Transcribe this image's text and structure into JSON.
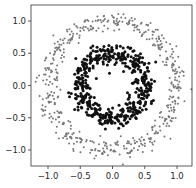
{
  "chart_data": {
    "type": "scatter",
    "title": "",
    "xlabel": "",
    "ylabel": "",
    "xlim": [
      -1.25,
      1.25
    ],
    "ylim": [
      -1.2,
      1.3
    ],
    "xticks": [
      -1.0,
      -0.5,
      0.0,
      0.5,
      1.0
    ],
    "xtick_labels": [
      "−1.0",
      "−0.5",
      "0.0",
      "0.5",
      "1.0"
    ],
    "yticks": [
      1.0,
      0.5,
      0.0,
      -0.5,
      -1.0
    ],
    "ytick_labels": [
      "1.0",
      "0.5",
      "0.0",
      "−0.5",
      "−1.0"
    ],
    "grid": false,
    "legend": null,
    "series": [
      {
        "name": "outer circle",
        "color": "#777777",
        "marker_size": 1.0,
        "center": [
          0.0,
          0.0
        ],
        "radius": 1.0,
        "noise": 0.08,
        "n_points": 500
      },
      {
        "name": "inner circle",
        "color": "#111111",
        "marker_size": 1.5,
        "center": [
          0.0,
          0.0
        ],
        "radius": 0.5,
        "noise": 0.08,
        "n_points": 500
      }
    ]
  },
  "layout": {
    "frame": {
      "left": 31,
      "top": 5,
      "right": 192,
      "bottom": 166
    },
    "x_tick_px": [
      48,
      80,
      112,
      144,
      177
    ],
    "y_tick_px": [
      21,
      53,
      86,
      118,
      150
    ]
  }
}
